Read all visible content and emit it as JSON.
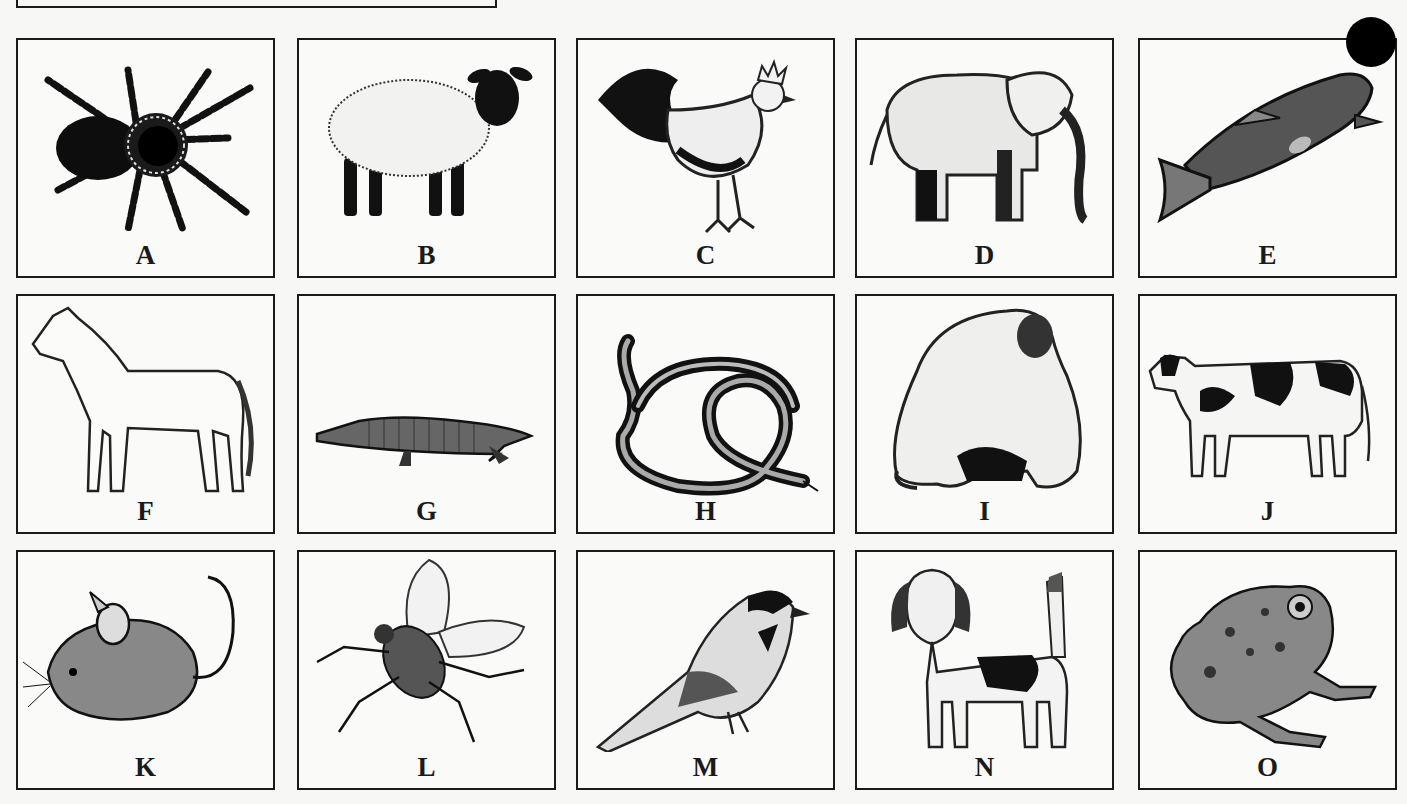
{
  "corner_marker": {
    "color": "#000000",
    "shape": "filled-circle"
  },
  "grid": {
    "columns": 5,
    "rows": 3,
    "card_border_color": "#1a1a1a",
    "label_color": "#1a1a1a"
  },
  "cards": [
    {
      "letter": "A",
      "animal": "tarantula"
    },
    {
      "letter": "B",
      "animal": "sheep"
    },
    {
      "letter": "C",
      "animal": "rooster"
    },
    {
      "letter": "D",
      "animal": "elephant"
    },
    {
      "letter": "E",
      "animal": "trout"
    },
    {
      "letter": "F",
      "animal": "horse"
    },
    {
      "letter": "G",
      "animal": "alligator"
    },
    {
      "letter": "H",
      "animal": "snake"
    },
    {
      "letter": "I",
      "animal": "gorilla"
    },
    {
      "letter": "J",
      "animal": "cow"
    },
    {
      "letter": "K",
      "animal": "mouse"
    },
    {
      "letter": "L",
      "animal": "fly"
    },
    {
      "letter": "M",
      "animal": "chickadee"
    },
    {
      "letter": "N",
      "animal": "beagle"
    },
    {
      "letter": "O",
      "animal": "frog"
    }
  ]
}
